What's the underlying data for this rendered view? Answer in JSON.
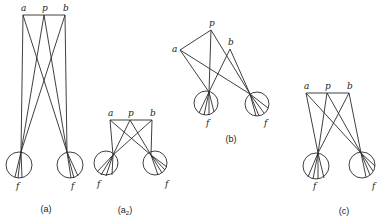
{
  "colors": {
    "ink": "#2a2a2a",
    "background": "#ffffff"
  },
  "panels": [
    {
      "id": "a",
      "caption": "(a)",
      "caption_pos": [
        46,
        212
      ],
      "points": {
        "a": [
          23,
          15
        ],
        "p": [
          44,
          15
        ],
        "b": [
          65,
          15
        ]
      },
      "point_labels": {
        "a": "a",
        "p": "p",
        "b": "b"
      },
      "eyes": [
        {
          "center": [
            19,
            165
          ],
          "r": 13,
          "node": [
            21,
            152
          ],
          "retina": [
            [
              15,
              177
            ],
            [
              18,
              178
            ],
            [
              22,
              178
            ]
          ],
          "label": "f",
          "label_pos": [
            16,
            189
          ]
        },
        {
          "center": [
            70,
            165
          ],
          "r": 13,
          "node": [
            67,
            152
          ],
          "retina": [
            [
              71,
              178
            ],
            [
              74,
              178
            ],
            [
              78,
              176
            ]
          ],
          "label": "f",
          "label_pos": [
            71,
            189
          ]
        }
      ]
    },
    {
      "id": "a2",
      "caption": "(a",
      "caption_sub": "2",
      "caption_close": ")",
      "caption_pos": [
        125,
        213
      ],
      "points": {
        "a": [
          110,
          120
        ],
        "p": [
          130,
          120
        ],
        "b": [
          152,
          120
        ]
      },
      "point_labels": {
        "a": "a",
        "p": "p",
        "b": "b"
      },
      "eyes": [
        {
          "center": [
            106,
            163
          ],
          "r": 12,
          "node": [
            113,
            155
          ],
          "retina": [
            [
              97,
              172
            ],
            [
              101,
              175
            ],
            [
              106,
              176
            ],
            [
              112,
              175
            ]
          ],
          "label": "f",
          "label_pos": [
            97,
            187
          ]
        },
        {
          "center": [
            155,
            163
          ],
          "r": 12,
          "node": [
            151,
            155
          ],
          "retina": [
            [
              158,
              175
            ],
            [
              162,
              173
            ],
            [
              165,
              170
            ],
            [
              167,
              167
            ]
          ],
          "label": "f",
          "label_pos": [
            165,
            187
          ]
        }
      ]
    },
    {
      "id": "b",
      "caption": "(b)",
      "caption_pos": [
        231,
        142
      ],
      "points": {
        "a": [
          180,
          50
        ],
        "p": [
          211,
          30
        ],
        "b": [
          230,
          49
        ]
      },
      "point_labels": {
        "a": "a",
        "p": "p",
        "b": "b"
      },
      "eyes": [
        {
          "center": [
            206,
            103
          ],
          "r": 12,
          "node": [
            209,
            92
          ],
          "retina": [
            [
              199,
              113
            ],
            [
              204,
              115
            ],
            [
              209,
              115
            ],
            [
              214,
              112
            ]
          ],
          "label": "f",
          "label_pos": [
            206,
            126
          ]
        },
        {
          "center": [
            257,
            104
          ],
          "r": 12,
          "node": [
            250,
            94
          ],
          "retina": [
            [
              256,
              116
            ],
            [
              259,
              116
            ],
            [
              264,
              113
            ],
            [
              268,
              108
            ]
          ],
          "label": "f",
          "label_pos": [
            264,
            126
          ]
        }
      ]
    },
    {
      "id": "c",
      "caption": "(c)",
      "caption_pos": [
        344,
        214
      ],
      "points": {
        "a": [
          306,
          93
        ],
        "p": [
          327,
          93
        ],
        "b": [
          349,
          93
        ]
      },
      "point_labels": {
        "a": "a",
        "p": "p",
        "b": "b"
      },
      "eyes": [
        {
          "center": [
            316,
            166
          ],
          "r": 13,
          "node": [
            318,
            153
          ],
          "retina": [
            [
              308,
              177
            ],
            [
              313,
              179
            ],
            [
              318,
              179
            ],
            [
              324,
              178
            ]
          ],
          "label": "f",
          "label_pos": [
            313,
            189
          ]
        },
        {
          "center": [
            362,
            165
          ],
          "r": 13,
          "node": [
            361,
            153
          ],
          "retina": [
            [
              366,
              177
            ],
            [
              370,
              175
            ],
            [
              373,
              171
            ],
            [
              375,
              166
            ]
          ],
          "label": "f",
          "label_pos": [
            372,
            189
          ]
        }
      ]
    }
  ]
}
